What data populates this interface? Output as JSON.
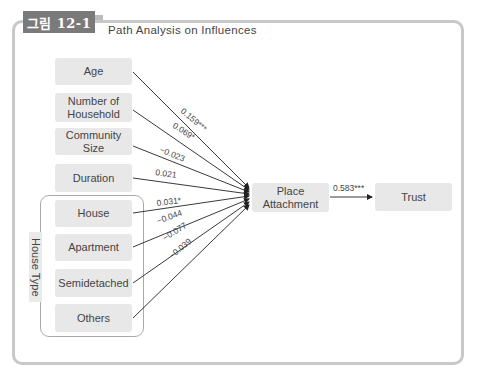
{
  "figure": {
    "tab_label": "그림 12-1",
    "title": "Path Analysis on Influences"
  },
  "nodes": {
    "age": "Age",
    "household_line1": "Number of",
    "household_line2": "Household",
    "community_size": "Community Size",
    "duration": "Duration",
    "house": "House",
    "apartment": "Apartment",
    "semidetached": "Semidetached",
    "others": "Others",
    "place_attachment_line1": "Place",
    "place_attachment_line2": "Attachment",
    "trust": "Trust"
  },
  "group": {
    "label": "House Type"
  },
  "paths": [
    {
      "from": "Age",
      "to": "Place Attachment",
      "coef": "0.159***"
    },
    {
      "from": "Number of Household",
      "to": "Place Attachment",
      "coef": "0.069*"
    },
    {
      "from": "Community Size",
      "to": "Place Attachment",
      "coef": "−0.023"
    },
    {
      "from": "Duration",
      "to": "Place Attachment",
      "coef": "0.021"
    },
    {
      "from": "House",
      "to": "Place Attachment",
      "coef": "0.031*"
    },
    {
      "from": "Apartment",
      "to": "Place Attachment",
      "coef": "−0.044"
    },
    {
      "from": "Semidetached",
      "to": "Place Attachment",
      "coef": "−0.077"
    },
    {
      "from": "Others",
      "to": "Place Attachment",
      "coef": "−0.039"
    },
    {
      "from": "Place Attachment",
      "to": "Trust",
      "coef": "0.583***"
    }
  ],
  "colors": {
    "tab_bg": "#7a7a7a",
    "node_bg": "#e8e8e8",
    "frame_border": "#c8c8c8",
    "line": "#222222"
  }
}
